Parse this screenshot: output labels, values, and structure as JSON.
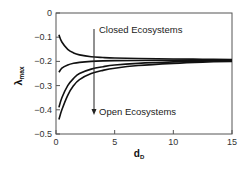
{
  "chart_data": {
    "type": "line",
    "title": "",
    "xlabel": "d",
    "xlabel_sub": "D",
    "ylabel": "λ",
    "ylabel_sub": "max",
    "xlim": [
      0,
      15
    ],
    "ylim": [
      -0.5,
      0
    ],
    "xticks": [
      0,
      5,
      10,
      15
    ],
    "yticks": [
      0,
      -0.1,
      -0.2,
      -0.3,
      -0.4,
      -0.5
    ],
    "xtick_labels": [
      "0",
      "5",
      "10",
      "15"
    ],
    "ytick_labels": [
      "0",
      "−0.1",
      "−0.2",
      "−0.3",
      "−0.4",
      "−0.5"
    ],
    "grid": false,
    "legend": null,
    "x": [
      0.25,
      0.5,
      1,
      1.5,
      2,
      3,
      4,
      5,
      7,
      10,
      12.5,
      15
    ],
    "series": [
      {
        "name": "Curve 1 (most closed)",
        "values": [
          -0.09,
          -0.12,
          -0.15,
          -0.165,
          -0.173,
          -0.181,
          -0.184,
          -0.186,
          -0.188,
          -0.19,
          -0.191,
          -0.192
        ]
      },
      {
        "name": "Curve 2",
        "values": [
          -0.245,
          -0.228,
          -0.215,
          -0.208,
          -0.204,
          -0.2,
          -0.198,
          -0.197,
          -0.196,
          -0.195,
          -0.195,
          -0.195
        ]
      },
      {
        "name": "Curve 3",
        "values": [
          -0.39,
          -0.35,
          -0.3,
          -0.27,
          -0.25,
          -0.232,
          -0.222,
          -0.215,
          -0.208,
          -0.202,
          -0.199,
          -0.197
        ]
      },
      {
        "name": "Curve 4 (most open)",
        "values": [
          -0.44,
          -0.4,
          -0.34,
          -0.3,
          -0.275,
          -0.25,
          -0.237,
          -0.228,
          -0.217,
          -0.208,
          -0.203,
          -0.2
        ]
      }
    ],
    "annotations": [
      {
        "text": "Closed Ecosystems",
        "x": 3.6,
        "y": -0.07
      },
      {
        "text": "Open Ecosystems",
        "x": 3.6,
        "y": -0.41
      },
      {
        "type": "arrow",
        "from": [
          3.25,
          -0.065
        ],
        "to": [
          3.25,
          -0.415
        ],
        "direction": "down"
      }
    ]
  },
  "labels": {
    "closed": "Closed Ecosystems",
    "open": "Open Ecosystems",
    "xlabel": "d",
    "xlabel_sub": "D",
    "ylabel": "λ",
    "ylabel_sub": "max"
  }
}
